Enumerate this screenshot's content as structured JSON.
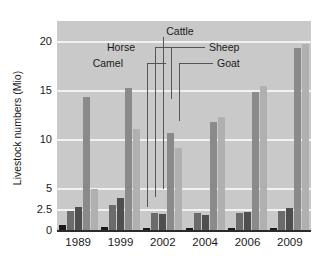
{
  "chart_data": {
    "type": "bar",
    "title": "",
    "subtitle": "",
    "xlabel": "",
    "ylabel": "Livestock numbers (Mio)",
    "categories": [
      "1989",
      "1999",
      "2002",
      "2004",
      "2006",
      "2009"
    ],
    "ytick_labels": [
      "0",
      "2.5",
      "5",
      "10",
      "15",
      "20"
    ],
    "ytick_values": [
      0,
      2.5,
      5,
      10,
      15,
      20
    ],
    "ylim": [
      0,
      20
    ],
    "grid": true,
    "grid_axis": "y",
    "legend_position": "inside-top-callouts",
    "annotations": [
      {
        "label": "Cattle",
        "series": "Cattle"
      },
      {
        "label": "Horse",
        "series": "Horse"
      },
      {
        "label": "Camel",
        "series": "Camel"
      },
      {
        "label": "Sheep",
        "series": "Sheep"
      },
      {
        "label": "Goat",
        "series": "Goat"
      }
    ],
    "series": [
      {
        "name": "Camel",
        "color": "#1a1a1a",
        "values": [
          0.55,
          0.36,
          0.26,
          0.26,
          0.25,
          0.28
        ]
      },
      {
        "name": "Horse",
        "color": "#6b6b6b",
        "values": [
          2.26,
          2.98,
          1.99,
          2.01,
          2.03,
          2.22
        ]
      },
      {
        "name": "Cattle",
        "color": "#4f4f4f",
        "values": [
          2.72,
          3.82,
          1.88,
          1.79,
          2.11,
          2.6
        ]
      },
      {
        "name": "Sheep",
        "color": "#8a8a8a",
        "values": [
          14.27,
          15.19,
          10.64,
          11.69,
          14.81,
          19.27
        ]
      },
      {
        "name": "Goat",
        "color": "#b0b0b0",
        "values": [
          4.88,
          11.06,
          9.13,
          12.24,
          15.45,
          19.65
        ]
      }
    ]
  },
  "style": {
    "plot_background": "#c9c9c9",
    "gridline_color": "#f2f2f2",
    "axis_color": "#2b2b2b",
    "text_color": "#1a1a1a",
    "page_background": "#ffffff"
  }
}
